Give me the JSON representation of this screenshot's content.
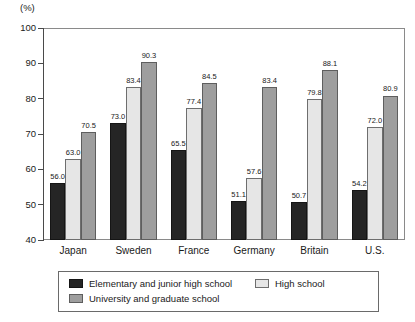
{
  "chart_data": {
    "type": "bar",
    "title": "",
    "subtitle": "",
    "unit_label": "(%)",
    "xlabel": "",
    "ylabel": "",
    "ylim": [
      40,
      100
    ],
    "ytick_step": 10,
    "yticks": [
      100,
      90,
      80,
      70,
      60,
      50,
      40
    ],
    "ytick_labels": [
      "100",
      "90",
      "80",
      "70",
      "60",
      "50",
      "40"
    ],
    "grid": false,
    "legend_position": "bottom",
    "categories": [
      "Japan",
      "Sweden",
      "France",
      "Germany",
      "Britain",
      "U.S."
    ],
    "series": [
      {
        "name": "Elementary and junior high school",
        "color": "#252525",
        "values": [
          56.0,
          73.0,
          65.5,
          51.1,
          50.7,
          54.2
        ],
        "labels": [
          "56.0",
          "73.0",
          "65.5",
          "51.1",
          "50.7",
          "54.2"
        ]
      },
      {
        "name": "High school",
        "color": "#e6e6e6",
        "values": [
          63.0,
          83.4,
          77.4,
          57.6,
          79.8,
          72.0
        ],
        "labels": [
          "63.0",
          "83.4",
          "77.4",
          "57.6",
          "79.8",
          "72.0"
        ]
      },
      {
        "name": "University and graduate school",
        "color": "#9e9e9e",
        "values": [
          70.5,
          90.3,
          84.5,
          83.4,
          88.1,
          80.9
        ],
        "labels": [
          "70.5",
          "90.3",
          "84.5",
          "83.4",
          "88.1",
          "80.9"
        ]
      }
    ]
  },
  "legend": {
    "entries": [
      {
        "label": "Elementary and junior high school",
        "swatch": "series-0"
      },
      {
        "label": "High school",
        "swatch": "series-1"
      },
      {
        "label": "University and graduate school",
        "swatch": "series-2"
      }
    ]
  },
  "colors": {
    "elementary": "#252525",
    "high_school": "#e6e6e6",
    "university": "#9e9e9e",
    "axis": "#4a4a4a",
    "frame": "#8a8a8a",
    "text": "#1a1a1a",
    "background": "#ffffff"
  }
}
